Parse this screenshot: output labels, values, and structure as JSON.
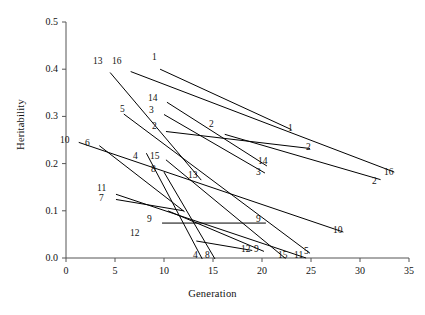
{
  "chart_data": {
    "type": "line",
    "title": "",
    "xlabel": "Generation",
    "ylabel": "Heritability",
    "xlim": [
      0,
      35
    ],
    "ylim": [
      0.0,
      0.5
    ],
    "xticks": [
      0,
      5,
      10,
      15,
      20,
      25,
      30,
      35
    ],
    "xtick_labels": [
      "0",
      "5",
      "10",
      "15",
      "20",
      "25",
      "30",
      "35"
    ],
    "yticks": [
      0.0,
      0.1,
      0.2,
      0.3,
      0.4,
      0.5
    ],
    "ytick_labels": [
      "0.0",
      "0.1",
      "0.2",
      "0.3",
      "0.4",
      "0.5"
    ],
    "grid": false,
    "legend": "none",
    "line_color": "#000000",
    "series": [
      {
        "name": "1",
        "label_start": "1",
        "label_end": "1",
        "x": [
          9.6,
          23.0
        ],
        "y": [
          0.4,
          0.272
        ]
      },
      {
        "name": "2",
        "label_start": "2",
        "label_end": "2",
        "x": [
          10.2,
          24.9
        ],
        "y": [
          0.268,
          0.232
        ]
      },
      {
        "name": "2b",
        "label_start": "2",
        "label_end": "2",
        "x": [
          16.2,
          32.1
        ],
        "y": [
          0.262,
          0.166
        ]
      },
      {
        "name": "3",
        "label_start": "3",
        "label_end": "3",
        "x": [
          10.0,
          20.3
        ],
        "y": [
          0.304,
          0.18
        ]
      },
      {
        "name": "4",
        "label_start": "4",
        "label_end": "4",
        "x": [
          8.2,
          13.9
        ],
        "y": [
          0.222,
          -0.002
        ]
      },
      {
        "name": "5",
        "label_start": "5",
        "label_end": "5",
        "x": [
          5.9,
          24.9
        ],
        "y": [
          0.305,
          0.01
        ]
      },
      {
        "name": "6",
        "label_start": "6",
        "label_end": "6",
        "x": [
          3.4,
          12.1
        ],
        "y": [
          0.238,
          0.098
        ]
      },
      {
        "name": "7",
        "label_start": "7",
        "label_end": "7",
        "x": [
          5.1,
          12.0
        ],
        "y": [
          0.124,
          0.1
        ]
      },
      {
        "name": "8",
        "label_start": "8",
        "label_end": "8",
        "x": [
          10.0,
          15.2
        ],
        "y": [
          0.182,
          -0.002
        ]
      },
      {
        "name": "9",
        "label_start": "9",
        "label_end": "9",
        "x": [
          9.8,
          20.4
        ],
        "y": [
          0.074,
          0.074
        ]
      },
      {
        "name": "9b",
        "label_start": "9",
        "label_end": "9",
        "x": [
          10.4,
          20.2
        ],
        "y": [
          0.1,
          0.014
        ]
      },
      {
        "name": "10",
        "label_start": "10",
        "label_end": "10",
        "x": [
          1.3,
          28.3
        ],
        "y": [
          0.245,
          0.055
        ]
      },
      {
        "name": "11",
        "label_start": "11",
        "label_end": "11",
        "x": [
          5.1,
          24.5
        ],
        "y": [
          0.135,
          0.0
        ]
      },
      {
        "name": "12",
        "label_start": "12",
        "label_end": "12",
        "x": [
          13.3,
          19.0
        ],
        "y": [
          0.036,
          0.016
        ]
      },
      {
        "name": "13",
        "label_start": "13",
        "label_end": "13",
        "x": [
          4.5,
          13.8
        ],
        "y": [
          0.393,
          0.165
        ]
      },
      {
        "name": "14",
        "label_start": "14",
        "label_end": "14",
        "x": [
          10.3,
          20.5
        ],
        "y": [
          0.33,
          0.195
        ]
      },
      {
        "name": "15",
        "label_start": "15",
        "label_end": "15",
        "x": [
          10.2,
          22.4
        ],
        "y": [
          0.208,
          -0.001
        ]
      },
      {
        "name": "16",
        "label_start": "16",
        "label_end": "16",
        "x": [
          6.6,
          33.5
        ],
        "y": [
          0.395,
          0.182
        ]
      }
    ],
    "point_labels": [
      {
        "text": "13",
        "x": 93,
        "y": 57
      },
      {
        "text": "16",
        "x": 112,
        "y": 57
      },
      {
        "text": "1",
        "x": 152,
        "y": 53
      },
      {
        "text": "14",
        "x": 148,
        "y": 94
      },
      {
        "text": "3",
        "x": 149,
        "y": 106
      },
      {
        "text": "5",
        "x": 120,
        "y": 105
      },
      {
        "text": "2",
        "x": 152,
        "y": 122
      },
      {
        "text": "2",
        "x": 209,
        "y": 120
      },
      {
        "text": "1",
        "x": 288,
        "y": 124
      },
      {
        "text": "2",
        "x": 306,
        "y": 143
      },
      {
        "text": "10",
        "x": 60,
        "y": 136
      },
      {
        "text": "6",
        "x": 85,
        "y": 139
      },
      {
        "text": "4",
        "x": 133,
        "y": 152
      },
      {
        "text": "15",
        "x": 150,
        "y": 152
      },
      {
        "text": "8",
        "x": 151,
        "y": 165
      },
      {
        "text": "13",
        "x": 188,
        "y": 171
      },
      {
        "text": "14",
        "x": 258,
        "y": 157
      },
      {
        "text": "3",
        "x": 256,
        "y": 168
      },
      {
        "text": "16",
        "x": 384,
        "y": 168
      },
      {
        "text": "2",
        "x": 372,
        "y": 177
      },
      {
        "text": "11",
        "x": 97,
        "y": 184
      },
      {
        "text": "7",
        "x": 99,
        "y": 194
      },
      {
        "text": "9",
        "x": 147,
        "y": 215
      },
      {
        "text": "9",
        "x": 256,
        "y": 215
      },
      {
        "text": "10",
        "x": 333,
        "y": 226
      },
      {
        "text": "12",
        "x": 130,
        "y": 229
      },
      {
        "text": "12",
        "x": 241,
        "y": 245
      },
      {
        "text": "9",
        "x": 254,
        "y": 245
      },
      {
        "text": "4",
        "x": 193,
        "y": 251
      },
      {
        "text": "8",
        "x": 205,
        "y": 251
      },
      {
        "text": "15",
        "x": 278,
        "y": 251
      },
      {
        "text": "11",
        "x": 294,
        "y": 251
      },
      {
        "text": "5",
        "x": 304,
        "y": 247
      }
    ]
  }
}
